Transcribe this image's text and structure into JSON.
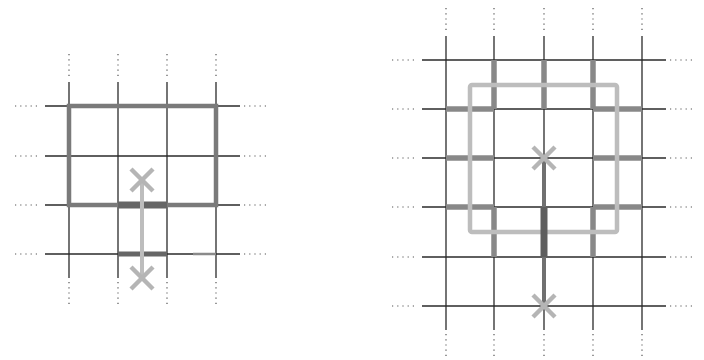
{
  "colors": {
    "grid": "#2a2a2a",
    "dots": "#555555",
    "dark_edge": "#7a7a7a",
    "darker_edge": "#666666",
    "light_path": "#bdbdbd",
    "cross": "#b5b5b5"
  },
  "left_diagram": {
    "xs": [
      69,
      118,
      167,
      216
    ],
    "ys": [
      106,
      156,
      205,
      254
    ],
    "boundary_rect": {
      "x1": 69,
      "y1": 106,
      "x2": 216,
      "y2": 205
    },
    "highlighted_edges": [
      {
        "x1": 118,
        "y1": 205,
        "x2": 167,
        "y2": 205,
        "w": 7
      },
      {
        "x1": 118,
        "y1": 254,
        "x2": 167,
        "y2": 254,
        "w": 5
      }
    ],
    "light_segment": {
      "x1": 142,
      "y1": 180,
      "x2": 142,
      "y2": 278
    },
    "crosses": [
      {
        "x": 142,
        "y": 180
      },
      {
        "x": 142,
        "y": 278
      }
    ]
  },
  "right_diagram": {
    "xs": [
      446,
      494,
      544,
      593,
      642
    ],
    "ys": [
      60,
      109,
      158,
      207,
      257,
      306
    ],
    "light_rect": {
      "x1": 470,
      "y1": 85,
      "x2": 617,
      "y2": 232
    },
    "highlighted_edges": [
      {
        "x1": 494,
        "y1": 60,
        "x2": 494,
        "y2": 109
      },
      {
        "x1": 544,
        "y1": 60,
        "x2": 544,
        "y2": 109
      },
      {
        "x1": 593,
        "y1": 60,
        "x2": 593,
        "y2": 109
      },
      {
        "x1": 446,
        "y1": 109,
        "x2": 494,
        "y2": 109
      },
      {
        "x1": 593,
        "y1": 109,
        "x2": 642,
        "y2": 109
      },
      {
        "x1": 446,
        "y1": 158,
        "x2": 494,
        "y2": 158
      },
      {
        "x1": 593,
        "y1": 158,
        "x2": 642,
        "y2": 158
      },
      {
        "x1": 446,
        "y1": 207,
        "x2": 494,
        "y2": 207
      },
      {
        "x1": 593,
        "y1": 207,
        "x2": 642,
        "y2": 207
      },
      {
        "x1": 494,
        "y1": 207,
        "x2": 494,
        "y2": 257
      },
      {
        "x1": 593,
        "y1": 207,
        "x2": 593,
        "y2": 257
      }
    ],
    "dark_path": {
      "x1": 544,
      "y1": 158,
      "x2": 544,
      "y2": 306
    },
    "dark_path_thick": {
      "x1": 544,
      "y1": 207,
      "x2": 544,
      "y2": 257
    },
    "crosses": [
      {
        "x": 544,
        "y": 158
      },
      {
        "x": 544,
        "y": 306
      }
    ]
  }
}
